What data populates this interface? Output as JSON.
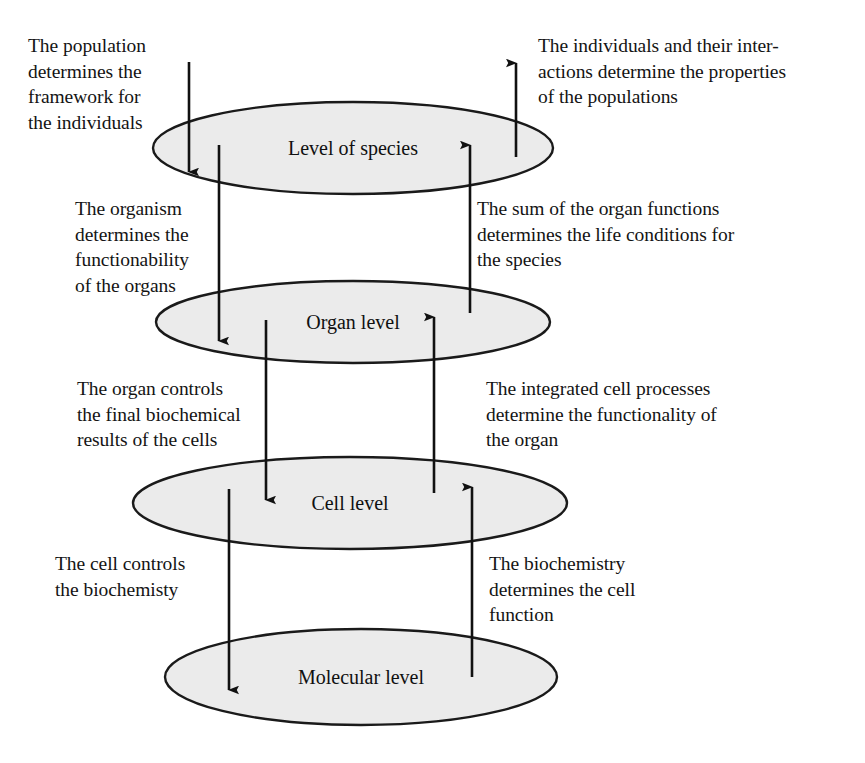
{
  "diagram": {
    "background_color": "#ffffff",
    "ellipse_fill": "#ebebeb",
    "ellipse_stroke": "#1a1a1a",
    "arrow_color": "#111111",
    "levels": [
      {
        "id": "species",
        "label": "Level of species",
        "cx": 353,
        "cy": 148,
        "rx": 200,
        "ry": 46
      },
      {
        "id": "organ",
        "label": "Organ level",
        "cx": 353,
        "cy": 322,
        "rx": 197,
        "ry": 41
      },
      {
        "id": "cell",
        "label": "Cell level",
        "cx": 350,
        "cy": 503,
        "rx": 217,
        "ry": 46
      },
      {
        "id": "molecular",
        "label": "Molecular level",
        "cx": 361,
        "cy": 677,
        "rx": 196,
        "ry": 48
      }
    ],
    "annotations": [
      {
        "id": "population-determines-framework",
        "side": "left",
        "pair": "species-down",
        "text": "The population\ndetermines the\nframework for\nthe individuals"
      },
      {
        "id": "individuals-determine-populations",
        "side": "right",
        "pair": "species-up",
        "text": "The individuals and their inter-\nactions determine the properties\nof the populations"
      },
      {
        "id": "organism-determines-organs",
        "side": "left",
        "pair": "organ-down",
        "text": "The organism\ndetermines the\nfunctionability\nof the organs"
      },
      {
        "id": "organ-functions-determine-life-conditions",
        "side": "right",
        "pair": "organ-up",
        "text": "The sum of the organ functions\ndetermines the life conditions for\nthe species"
      },
      {
        "id": "organ-controls-biochemical-results",
        "side": "left",
        "pair": "cell-down",
        "text": "The organ controls\nthe final biochemical\nresults of the cells"
      },
      {
        "id": "cell-processes-determine-organ",
        "side": "right",
        "pair": "cell-up",
        "text": "The integrated cell processes\ndetermine the functionality of\nthe organ"
      },
      {
        "id": "cell-controls-biochemistry",
        "side": "left",
        "pair": "molecular-down",
        "text": "The cell controls\nthe biochemisty"
      },
      {
        "id": "biochemistry-determines-cell-function",
        "side": "right",
        "pair": "molecular-up",
        "text": "The biochemistry\ndetermines the cell\nfunction"
      }
    ],
    "arrows": [
      {
        "id": "arrow-down-species-to-species",
        "direction": "down",
        "x": 189,
        "y1": 62,
        "y2": 172
      },
      {
        "id": "arrow-down-species-to-organ",
        "direction": "down",
        "x": 219,
        "y1": 145,
        "y2": 341
      },
      {
        "id": "arrow-down-organ-to-cell",
        "direction": "down",
        "x": 266,
        "y1": 320,
        "y2": 500
      },
      {
        "id": "arrow-down-cell-to-molecular",
        "direction": "down",
        "x": 229,
        "y1": 489,
        "y2": 690
      },
      {
        "id": "arrow-up-species-out",
        "direction": "up",
        "x": 516,
        "y1": 157,
        "y2": 63
      },
      {
        "id": "arrow-up-organ-to-species",
        "direction": "up",
        "x": 470,
        "y1": 313,
        "y2": 145
      },
      {
        "id": "arrow-up-cell-to-organ",
        "direction": "up",
        "x": 434,
        "y1": 493,
        "y2": 317
      },
      {
        "id": "arrow-up-molecular-to-cell",
        "direction": "up",
        "x": 472,
        "y1": 677,
        "y2": 487
      }
    ]
  }
}
